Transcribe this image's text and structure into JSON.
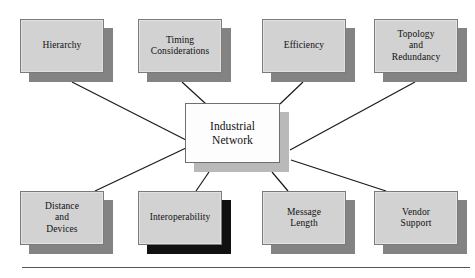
{
  "diagram": {
    "center": {
      "id": "industrial-network",
      "label": "Industrial\nNetwork",
      "x": 185,
      "y": 103,
      "w": 104,
      "h": 69,
      "face_color": "#fdfdfd",
      "shadow_color": "#b9b9b9"
    },
    "nodes": [
      {
        "id": "hierarchy",
        "label": "Hierarchy",
        "x": 20,
        "y": 19,
        "w": 93,
        "h": 63,
        "face_color": "#d2d2d2",
        "shadow_color": "#838383"
      },
      {
        "id": "timing-considerations",
        "label": "Timing\nConsiderations",
        "x": 138,
        "y": 19,
        "w": 93,
        "h": 63,
        "face_color": "#d2d2d2",
        "shadow_color": "#838383"
      },
      {
        "id": "efficiency",
        "label": "Efficiency",
        "x": 262,
        "y": 19,
        "w": 93,
        "h": 63,
        "face_color": "#d2d2d2",
        "shadow_color": "#838383"
      },
      {
        "id": "topology-and-redundancy",
        "label": "Topology\nand\nRedundancy",
        "x": 374,
        "y": 19,
        "w": 93,
        "h": 63,
        "face_color": "#d2d2d2",
        "shadow_color": "#838383"
      },
      {
        "id": "distance-and-devices",
        "label": "Distance\nand\nDevices",
        "x": 20,
        "y": 191,
        "w": 93,
        "h": 63,
        "face_color": "#d2d2d2",
        "shadow_color": "#838383"
      },
      {
        "id": "interoperability",
        "label": "Interoperability",
        "x": 138,
        "y": 191,
        "w": 93,
        "h": 63,
        "face_color": "#d2d2d2",
        "shadow_color": "#111111"
      },
      {
        "id": "message-length",
        "label": "Message\nLength",
        "x": 262,
        "y": 191,
        "w": 93,
        "h": 63,
        "face_color": "#d2d2d2",
        "shadow_color": "#838383"
      },
      {
        "id": "vendor-support",
        "label": "Vendor\nSupport",
        "x": 374,
        "y": 191,
        "w": 93,
        "h": 63,
        "face_color": "#d2d2d2",
        "shadow_color": "#838383"
      }
    ],
    "connectors": [
      {
        "from": "hierarchy",
        "to": "industrial-network",
        "x1": 72,
        "y1": 82,
        "x2": 186,
        "y2": 140
      },
      {
        "from": "timing-considerations",
        "to": "industrial-network",
        "x1": 182,
        "y1": 82,
        "x2": 206,
        "y2": 104
      },
      {
        "from": "efficiency",
        "to": "industrial-network",
        "x1": 303,
        "y1": 82,
        "x2": 280,
        "y2": 104
      },
      {
        "from": "topology-and-redundancy",
        "to": "industrial-network",
        "x1": 415,
        "y1": 82,
        "x2": 290,
        "y2": 150
      },
      {
        "from": "distance-and-devices",
        "to": "industrial-network",
        "x1": 95,
        "y1": 191,
        "x2": 186,
        "y2": 148
      },
      {
        "from": "interoperability",
        "to": "industrial-network",
        "x1": 196,
        "y1": 191,
        "x2": 209,
        "y2": 172
      },
      {
        "from": "message-length",
        "to": "industrial-network",
        "x1": 288,
        "y1": 191,
        "x2": 272,
        "y2": 172
      },
      {
        "from": "vendor-support",
        "to": "industrial-network",
        "x1": 386,
        "y1": 191,
        "x2": 291,
        "y2": 160
      }
    ],
    "connector_color": "#1a1a1a",
    "bottom_rule": {
      "x": 22,
      "y": 267,
      "w": 448,
      "color": "#555555"
    }
  }
}
